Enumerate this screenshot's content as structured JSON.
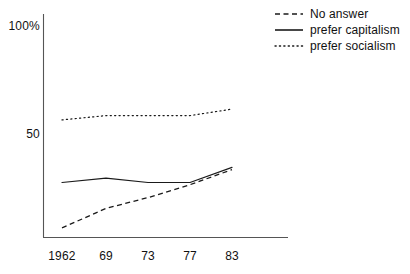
{
  "chart_data": {
    "type": "line",
    "title": "",
    "xlabel": "",
    "ylabel": "",
    "x": [
      1962,
      1969,
      1973,
      1977,
      1983
    ],
    "categories": [
      "1962",
      "69",
      "73",
      "77",
      "83"
    ],
    "xtick_labels": [
      "1962",
      "69",
      "73",
      "77",
      "83"
    ],
    "ytick_labels": [
      "100%",
      "50"
    ],
    "ytick_values": [
      100,
      50
    ],
    "ylim": [
      0,
      100
    ],
    "grid": false,
    "legend_position": "top-right",
    "series": [
      {
        "name": "No answer",
        "style": "dashed",
        "color": "#1a1a1a",
        "values": [
          7,
          16,
          21,
          27,
          34
        ]
      },
      {
        "name": "prefer capitalism",
        "style": "solid",
        "color": "#1a1a1a",
        "values": [
          28,
          30,
          28,
          28,
          35
        ]
      },
      {
        "name": "prefer socialism",
        "style": "dotted",
        "color": "#1a1a1a",
        "values": [
          57,
          59,
          59,
          59,
          62
        ]
      }
    ]
  },
  "axes": {
    "y_top_label": "100%",
    "y_mid_label": "50"
  },
  "legend": {
    "items": [
      {
        "label": "No answer",
        "style": "dashed"
      },
      {
        "label": "prefer capitalism",
        "style": "solid"
      },
      {
        "label": "prefer socialism",
        "style": "dotted"
      }
    ]
  },
  "colors": {
    "ink": "#1a1a1a",
    "axis": "#555555",
    "background": "#ffffff"
  }
}
